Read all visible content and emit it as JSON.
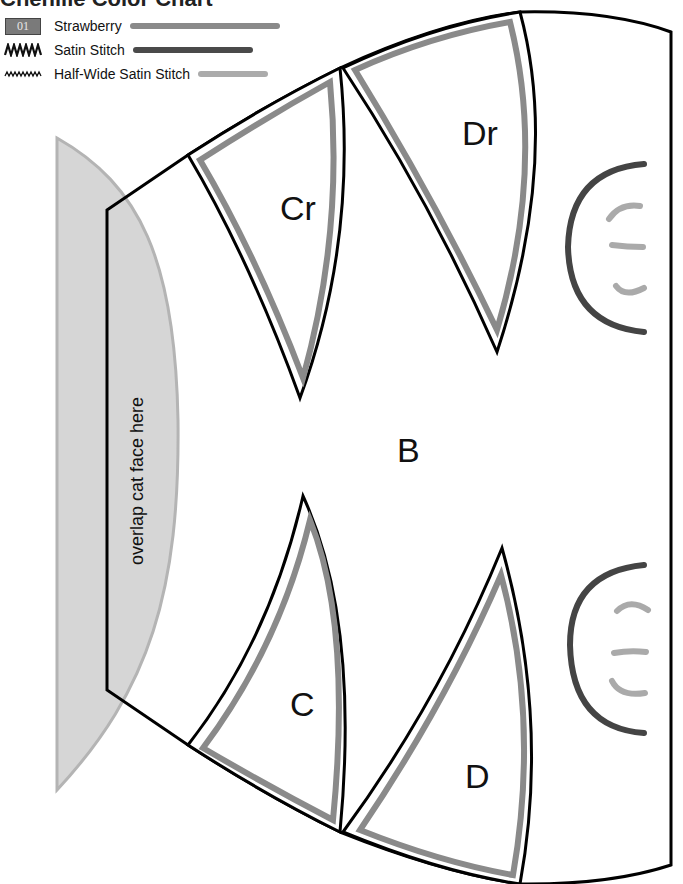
{
  "title": "Chenille Color Chart",
  "legend": {
    "items": [
      {
        "swatch": "01",
        "label": "Strawberry",
        "line_color": "#8a8a8a",
        "line_width": 150
      },
      {
        "swatch_icon": "satin-stitch-zigzag",
        "label": "Satin Stitch",
        "line_color": "#4a4a4a",
        "line_width": 120
      },
      {
        "swatch_icon": "half-wide-satin-stitch-zigzag",
        "label": "Half-Wide Satin Stitch",
        "line_color": "#ababab",
        "line_width": 70
      }
    ]
  },
  "pieces": {
    "main": "B",
    "upper_inner": "Cr",
    "upper_outer": "Dr",
    "lower_inner": "C",
    "lower_outer": "D"
  },
  "overlap_note": "overlap cat face here",
  "colors": {
    "outline": "#000000",
    "strawberry": "#8a8a8a",
    "satin": "#444444",
    "half_wide_satin": "#aaaaaa",
    "overlap_fill": "#d6d6d6",
    "overlap_edge": "#b4b4b4"
  }
}
